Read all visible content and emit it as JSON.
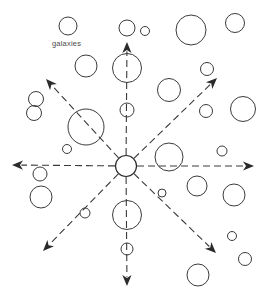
{
  "figure": {
    "title": "",
    "background_color": "#ffffff",
    "stroke_color": "#3b3b3b",
    "width": 271,
    "height": 302
  },
  "labels": [
    {
      "id": "galaxies-label",
      "text": "galaxies",
      "x": 52,
      "y": 46,
      "color": "#4a4a4a"
    }
  ],
  "center": {
    "name": "observer-center",
    "cx": 126,
    "cy": 166,
    "r": 10.5
  },
  "rays": [
    {
      "id": "ray-up",
      "direction": "up",
      "angle_deg": 90,
      "tip_x": 127,
      "tip_y": 42,
      "start_offset": 11,
      "dashed": true
    },
    {
      "id": "ray-up-right",
      "direction": "up-right",
      "angle_deg": 45,
      "tip_x": 217,
      "tip_y": 78,
      "start_offset": 11,
      "dashed": true
    },
    {
      "id": "ray-right",
      "direction": "right",
      "angle_deg": 0,
      "tip_x": 254,
      "tip_y": 166,
      "start_offset": 11,
      "dashed": true
    },
    {
      "id": "ray-down-right",
      "direction": "down-right",
      "angle_deg": -45,
      "tip_x": 216,
      "tip_y": 253,
      "start_offset": 11,
      "dashed": true
    },
    {
      "id": "ray-down",
      "direction": "down",
      "angle_deg": -90,
      "tip_x": 127,
      "tip_y": 286,
      "start_offset": 11,
      "dashed": true
    },
    {
      "id": "ray-down-left",
      "direction": "down-left",
      "angle_deg": -135,
      "tip_x": 43,
      "tip_y": 251,
      "start_offset": 11,
      "dashed": true
    },
    {
      "id": "ray-left",
      "direction": "left",
      "angle_deg": 180,
      "tip_x": 12,
      "tip_y": 165,
      "start_offset": 11,
      "dashed": true
    },
    {
      "id": "ray-up-left",
      "direction": "up-left",
      "angle_deg": 135,
      "tip_x": 46,
      "tip_y": 79,
      "start_offset": 11,
      "dashed": true
    }
  ],
  "galaxies": [
    {
      "id": "g01",
      "cx": 68,
      "cy": 26,
      "r": 9
    },
    {
      "id": "g02",
      "cx": 127,
      "cy": 28,
      "r": 8
    },
    {
      "id": "g03",
      "cx": 145,
      "cy": 31,
      "r": 4.5
    },
    {
      "id": "g04",
      "cx": 191,
      "cy": 30,
      "r": 15
    },
    {
      "id": "g05",
      "cx": 235,
      "cy": 23,
      "r": 9.5
    },
    {
      "id": "g06",
      "cx": 86,
      "cy": 66,
      "r": 11
    },
    {
      "id": "g07",
      "cx": 127,
      "cy": 68,
      "r": 14.5
    },
    {
      "id": "g08",
      "cx": 207,
      "cy": 69,
      "r": 6.5
    },
    {
      "id": "g09",
      "cx": 36,
      "cy": 99,
      "r": 7.5
    },
    {
      "id": "g10",
      "cx": 169,
      "cy": 90,
      "r": 11.5
    },
    {
      "id": "g11",
      "cx": 34,
      "cy": 113,
      "r": 7.5
    },
    {
      "id": "g12",
      "cx": 86,
      "cy": 127,
      "r": 18
    },
    {
      "id": "g13",
      "cx": 127,
      "cy": 110,
      "r": 7
    },
    {
      "id": "g14",
      "cx": 206,
      "cy": 111,
      "r": 6.5
    },
    {
      "id": "g15",
      "cx": 243,
      "cy": 109,
      "r": 12.5,
      "clipped": true
    },
    {
      "id": "g16",
      "cx": 67,
      "cy": 149,
      "r": 4.5
    },
    {
      "id": "g17",
      "cx": 169,
      "cy": 157,
      "r": 14
    },
    {
      "id": "g18",
      "cx": 222,
      "cy": 151,
      "r": 5
    },
    {
      "id": "g19",
      "cx": 40,
      "cy": 174,
      "r": 7
    },
    {
      "id": "g20",
      "cx": 197,
      "cy": 186,
      "r": 10
    },
    {
      "id": "g21",
      "cx": 162,
      "cy": 193,
      "r": 4
    },
    {
      "id": "g22",
      "cx": 234,
      "cy": 195,
      "r": 11
    },
    {
      "id": "g23",
      "cx": 41,
      "cy": 197,
      "r": 11
    },
    {
      "id": "g24",
      "cx": 127,
      "cy": 215,
      "r": 14.5
    },
    {
      "id": "g25",
      "cx": 85,
      "cy": 213,
      "r": 5
    },
    {
      "id": "g26",
      "cx": 232,
      "cy": 236,
      "r": 4.5
    },
    {
      "id": "g27",
      "cx": 245,
      "cy": 259,
      "r": 6.5
    },
    {
      "id": "g28",
      "cx": 127,
      "cy": 249,
      "r": 6
    },
    {
      "id": "g29",
      "cx": 198,
      "cy": 275,
      "r": 11
    }
  ],
  "legend": {
    "items": [
      {
        "symbol": "circle-outline",
        "meaning": "galaxies"
      },
      {
        "symbol": "dashed-arrow",
        "meaning": "recession direction"
      }
    ]
  }
}
